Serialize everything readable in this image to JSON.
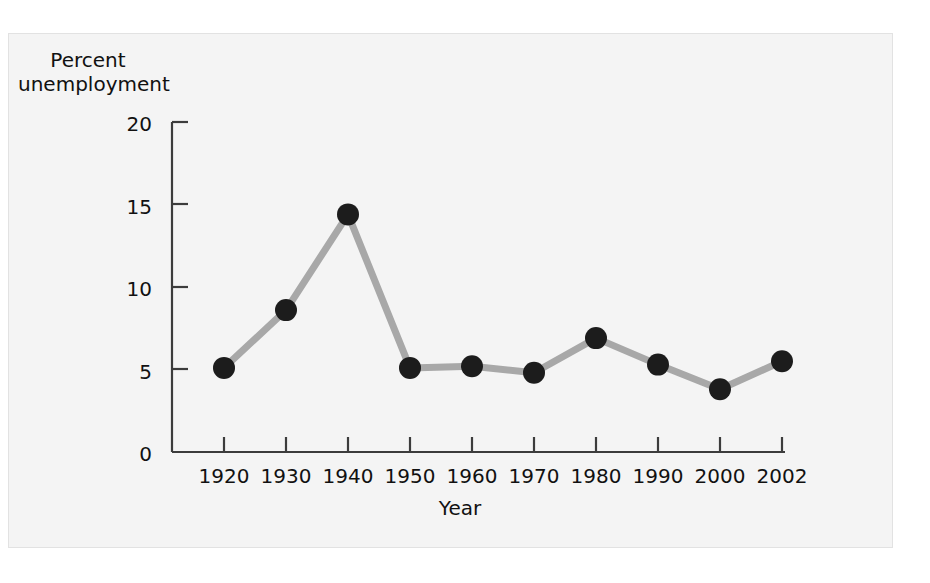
{
  "figure": {
    "background_color": "#f4f4f4",
    "border_color": "#e2e2e2",
    "page_background": "#ffffff"
  },
  "chart_data": {
    "type": "line",
    "title": "",
    "subtitle": "",
    "xlabel": "Year",
    "ylabel": "Percent unemployment",
    "ylabel_line1": "Percent",
    "ylabel_line2": "unemployment",
    "categories": [
      "1920",
      "1930",
      "1940",
      "1950",
      "1960",
      "1970",
      "1980",
      "1990",
      "2000",
      "2002"
    ],
    "x": [
      1920,
      1930,
      1940,
      1950,
      1960,
      1970,
      1980,
      1990,
      2000,
      2002
    ],
    "values": [
      5.1,
      8.6,
      14.4,
      5.1,
      5.2,
      4.8,
      6.9,
      5.3,
      3.8,
      5.5
    ],
    "series": [
      {
        "name": "Percent unemployment",
        "values": [
          5.1,
          8.6,
          14.4,
          5.1,
          5.2,
          4.8,
          6.9,
          5.3,
          3.8,
          5.5
        ]
      }
    ],
    "ylim": [
      0,
      20
    ],
    "yticks": [
      0,
      5,
      10,
      15,
      20
    ],
    "ytick_labels": [
      "0",
      "5",
      "10",
      "15",
      "20"
    ],
    "xtick_labels": [
      "1920",
      "1930",
      "1940",
      "1950",
      "1960",
      "1970",
      "1980",
      "1990",
      "2000",
      "2002"
    ],
    "grid": false,
    "legend": false,
    "legend_position": "none",
    "line_color": "#a8a8a8",
    "marker_color": "#1c1c1c",
    "marker_shape": "circle",
    "axis_color": "#3c3c3c",
    "text_color": "#111111",
    "annotations": []
  }
}
